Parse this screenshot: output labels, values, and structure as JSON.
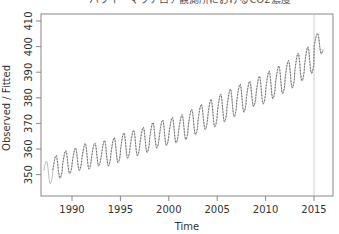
{
  "chart_data": {
    "type": "line",
    "title": "ハワイ・マウナロア観測所におけるCO2濃度",
    "xlabel": "Time",
    "ylabel": "Observed / Fitted",
    "xlim": [
      1987.0,
      2016.2
    ],
    "ylim": [
      344,
      411
    ],
    "x_ticks": [
      1990,
      1995,
      2000,
      2005,
      2010,
      2015
    ],
    "y_ticks": [
      350,
      360,
      370,
      380,
      390,
      400,
      410
    ],
    "grid": false,
    "legend": null,
    "vertical_marker": {
      "x": 2015.0,
      "color": "#cccccc"
    },
    "series": [
      {
        "name": "Observed",
        "style": "solid",
        "color": "#aaaaaa",
        "years": [
          1987,
          1988,
          1989,
          1990,
          1991,
          1992,
          1993,
          1994,
          1995,
          1996,
          1997,
          1998,
          1999,
          2000,
          2001,
          2002,
          2003,
          2004,
          2005,
          2006,
          2007,
          2008,
          2009,
          2010,
          2011,
          2012,
          2013,
          2014,
          2015
        ],
        "annual_max": [
          355,
          357,
          359,
          360,
          362,
          362,
          363,
          364,
          366,
          367,
          368,
          370,
          371,
          372,
          373,
          375,
          377,
          379,
          381,
          383,
          385,
          386,
          388,
          390,
          392,
          394,
          397,
          399,
          405
        ],
        "annual_min": [
          346,
          348,
          350,
          351,
          352,
          353,
          353,
          354,
          356,
          357,
          358,
          360,
          361,
          362,
          363,
          365,
          367,
          368,
          370,
          372,
          374,
          376,
          377,
          379,
          381,
          383,
          386,
          388,
          397
        ]
      },
      {
        "name": "Fitted",
        "style": "dashed",
        "color": "#555555",
        "start": 1988.0,
        "end": 2016.0
      }
    ]
  }
}
